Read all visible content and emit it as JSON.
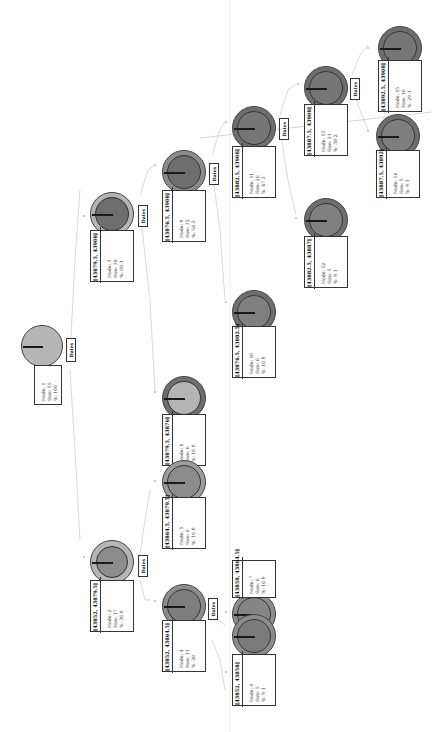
{
  "diagram": {
    "type": "decision-tree",
    "orientation": "rotated-90-clockwise",
    "split_label": "Dates",
    "colors": {
      "pie_light": "#b5b5b5",
      "pie_dark": "#6e6e6e",
      "pie_medium": "#8c8c8c",
      "needle": "#1a1a1a",
      "edge": "#c8c8c8",
      "border": "#333333"
    },
    "nodes": [
      {
        "id": 1,
        "range": "",
        "node": "Node: 1",
        "size": "Size: 55",
        "pct": "%: 100"
      },
      {
        "id": 2,
        "range": "[43852, 43879.5]",
        "node": "Node: 2",
        "size": "Size: 17",
        "pct": "%: 30.9"
      },
      {
        "id": 3,
        "range": "[43879.5, 43908]",
        "node": "Node: 3",
        "size": "Size: 38",
        "pct": "%: 69.1"
      },
      {
        "id": 4,
        "range": "[43852, 43864.5]",
        "node": "Node: 4",
        "size": "Size: 11",
        "pct": "%: 20"
      },
      {
        "id": 5,
        "range": "[43864.5, 43879.5]",
        "node": "Node: 5",
        "size": "Size: 6",
        "pct": "%: 10.9"
      },
      {
        "id": 6,
        "range": "[43852, 43858]",
        "node": "Node: 6",
        "size": "Size: 5",
        "pct": "%: 9.1"
      },
      {
        "id": 7,
        "range": "[43858, 43864.5]",
        "node": "Node: 7",
        "size": "Size: 6",
        "pct": "%: 10.9"
      },
      {
        "id": 8,
        "range": "[43879.5, 43876]",
        "node": "Node: 8",
        "size": "Size: 6",
        "pct": "%: 10.9"
      },
      {
        "id": 9,
        "range": "[43876.5, 43908]",
        "node": "Node: 9",
        "size": "Size: 32",
        "pct": "%: 58.2"
      },
      {
        "id": 10,
        "range": "[43876.5, 43882.5]",
        "node": "Node: 10",
        "size": "Size: 6",
        "pct": "%: 10.9"
      },
      {
        "id": 11,
        "range": "[43882.5, 43908]",
        "node": "Node: 11",
        "size": "Size: 26",
        "pct": "%: 47.3"
      },
      {
        "id": 12,
        "range": "[43882.5, 43887]",
        "node": "Node: 12",
        "size": "Size: 5",
        "pct": "%: 9.1"
      },
      {
        "id": 13,
        "range": "[43887.5, 43908]",
        "node": "Node: 13",
        "size": "Size: 21",
        "pct": "%: 38.2"
      },
      {
        "id": 14,
        "range": "[43887.5, 43892]",
        "node": "Node: 14",
        "size": "Size: 5",
        "pct": "%: 9.1"
      },
      {
        "id": 15,
        "range": "[43892.5, 43908]",
        "node": "Node: 15",
        "size": "Size: 16",
        "pct": "%: 29.1"
      }
    ]
  }
}
